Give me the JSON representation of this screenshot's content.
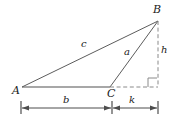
{
  "figure": {
    "type": "geometry-diagram",
    "background_color": "#ffffff",
    "stroke_color": "#595959",
    "label_color": "#1a1a1a",
    "vertices": [
      {
        "name": "A",
        "label": "A",
        "x": 22,
        "y": 87
      },
      {
        "name": "B",
        "label": "B",
        "x": 158,
        "y": 21
      },
      {
        "name": "C",
        "label": "C",
        "x": 110,
        "y": 87
      }
    ],
    "foot_of_altitude": {
      "name": "D",
      "x": 158,
      "y": 87
    },
    "solid_segments": [
      {
        "name": "side-c-AB",
        "label": "c",
        "from": "A",
        "to": "B"
      },
      {
        "name": "side-a-CB",
        "label": "a",
        "from": "C",
        "to": "B"
      },
      {
        "name": "base-b-AC",
        "label": "b",
        "from": "A",
        "to": "C"
      }
    ],
    "dashed_segments": [
      {
        "name": "altitude-h",
        "label": "h",
        "from": "B",
        "to": "D"
      },
      {
        "name": "base-extension-k",
        "label": "k",
        "from": "C",
        "to": "D"
      }
    ],
    "right_angle_marker": {
      "name": "right-angle-at-foot",
      "x": 148,
      "y": 77,
      "size": 9
    },
    "labels": {
      "vertex_a": "A",
      "vertex_b": "B",
      "vertex_c": "C",
      "side_c": "c",
      "side_a": "a",
      "height_h": "h",
      "base_b": "b",
      "segment_k": "k"
    },
    "dimension_line": {
      "name": "baseline-dimension",
      "y": 108,
      "ticks": [
        21,
        112,
        158
      ],
      "spans": [
        {
          "name": "dimension-b",
          "label": "b",
          "from_x": 21,
          "to_x": 112
        },
        {
          "name": "dimension-k",
          "label": "k",
          "from_x": 112,
          "to_x": 158
        }
      ]
    }
  }
}
